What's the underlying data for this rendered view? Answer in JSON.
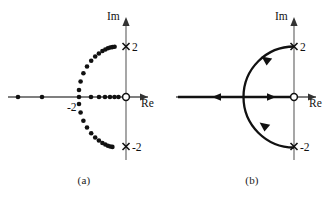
{
  "figure": {
    "panels": [
      {
        "id": "a",
        "caption": "(a)",
        "axes": {
          "imaginary_label": "Im",
          "real_label": "Re",
          "origin_marker": "open-circle-zero"
        },
        "annotations": {
          "pole_upper_label": "2",
          "pole_lower_label": "-2",
          "real_axis_label": "-2"
        },
        "poles": [
          {
            "re": 0,
            "im": 2,
            "symbol": "x"
          },
          {
            "re": 0,
            "im": -2,
            "symbol": "x"
          }
        ],
        "zeros": [
          {
            "re": 0,
            "im": 0,
            "symbol": "o"
          }
        ],
        "locus_style": "dotted",
        "real_axis_dots_re": [
          -6.6,
          -5.1,
          -2.05,
          -1.35,
          -0.95,
          -0.62,
          -0.45,
          -0.3,
          -0.17
        ],
        "upper_branch_points": [
          {
            "re": -2.05,
            "im": 0.28
          },
          {
            "re": -1.95,
            "im": 0.62
          },
          {
            "re": -1.78,
            "im": 0.95
          },
          {
            "re": -1.56,
            "im": 1.22
          },
          {
            "re": -1.3,
            "im": 1.45
          },
          {
            "re": -1.05,
            "im": 1.62
          },
          {
            "re": -0.82,
            "im": 1.74
          },
          {
            "re": -0.6,
            "im": 1.84
          },
          {
            "re": -0.42,
            "im": 1.9
          },
          {
            "re": -0.26,
            "im": 1.95
          },
          {
            "re": -0.12,
            "im": 1.98
          }
        ],
        "lower_branch_points": [
          {
            "re": -2.05,
            "im": -0.28
          },
          {
            "re": -1.95,
            "im": -0.62
          },
          {
            "re": -1.78,
            "im": -0.95
          },
          {
            "re": -1.56,
            "im": -1.22
          },
          {
            "re": -1.3,
            "im": -1.45
          },
          {
            "re": -1.05,
            "im": -1.62
          },
          {
            "re": -0.82,
            "im": -1.74
          },
          {
            "re": -0.6,
            "im": -1.84
          },
          {
            "re": -0.42,
            "im": -1.9
          },
          {
            "re": -0.26,
            "im": -1.95
          },
          {
            "re": -0.12,
            "im": -1.98
          }
        ]
      },
      {
        "id": "b",
        "caption": "(b)",
        "axes": {
          "imaginary_label": "Im",
          "real_label": "Re",
          "origin_marker": "open-circle-zero"
        },
        "annotations": {
          "pole_upper_label": "2",
          "pole_lower_label": "-2"
        },
        "poles": [
          {
            "re": 0,
            "im": 2,
            "symbol": "x"
          },
          {
            "re": 0,
            "im": -2,
            "symbol": "x"
          }
        ],
        "zeros": [
          {
            "re": 0,
            "im": 0,
            "symbol": "o"
          }
        ],
        "locus_style": "solid-with-direction-arrows",
        "arrow_directions": [
          {
            "on": "real-axis-left",
            "direction": "left"
          },
          {
            "on": "real-axis-right",
            "direction": "right"
          },
          {
            "on": "arc-upper",
            "direction": "counterclockwise"
          },
          {
            "on": "arc-lower",
            "direction": "clockwise"
          }
        ],
        "arc_radius": 2,
        "arc_center": {
          "re": 0,
          "im": 0
        }
      }
    ]
  },
  "colors": {
    "stroke": "#1a1a1a",
    "background": "#ffffff",
    "axis": "#555555"
  }
}
